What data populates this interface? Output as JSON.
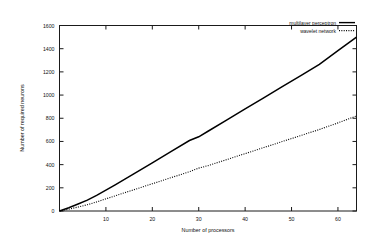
{
  "chart_data": {
    "type": "line",
    "title": "",
    "xlabel": "Number of processors",
    "ylabel": "Number of required neurons",
    "xlim": [
      0,
      64
    ],
    "ylim": [
      0,
      1600
    ],
    "xticks": [
      10,
      20,
      30,
      40,
      50,
      60
    ],
    "yticks": [
      0,
      200,
      400,
      600,
      800,
      1000,
      1200,
      1400,
      1600
    ],
    "grid": false,
    "legend_position": "top-right-inside",
    "x": [
      0,
      2,
      4,
      6,
      8,
      10,
      12,
      14,
      16,
      18,
      20,
      24,
      28,
      30,
      32,
      36,
      40,
      44,
      48,
      52,
      56,
      60,
      64
    ],
    "series": [
      {
        "name": "multilayer perceptron",
        "style": "solid",
        "values": [
          0,
          28,
          60,
          94,
          134,
          180,
          226,
          272,
          320,
          368,
          416,
          512,
          608,
          640,
          688,
          784,
          880,
          976,
          1072,
          1168,
          1264,
          1384,
          1500
        ]
      },
      {
        "name": "wavelet network",
        "style": "dotted",
        "values": [
          0,
          16,
          34,
          54,
          78,
          105,
          131,
          157,
          183,
          209,
          235,
          287,
          339,
          370,
          391,
          443,
          495,
          547,
          599,
          651,
          703,
          760,
          820
        ]
      }
    ]
  },
  "legend": {
    "entries": [
      {
        "label": "multilayer perceptron",
        "style": "solid"
      },
      {
        "label": "wavelet network",
        "style": "dotted"
      }
    ]
  },
  "axis": {
    "x_title": "Number of processors",
    "y_title": "Number of required neurons",
    "xtick_labels": [
      "10",
      "20",
      "30",
      "40",
      "50",
      "60"
    ],
    "ytick_labels": [
      "0",
      "200",
      "400",
      "600",
      "800",
      "1000",
      "1200",
      "1400",
      "1600"
    ]
  }
}
